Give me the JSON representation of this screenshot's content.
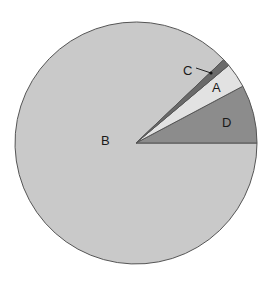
{
  "chart_data": {
    "type": "pie",
    "title": "",
    "categories": [
      "D",
      "A",
      "C",
      "B"
    ],
    "values": [
      7.8,
      3.4,
      1.0,
      87.8
    ],
    "angles_deg": [
      28,
      12,
      3.5,
      316.5
    ],
    "colors": [
      "#8c8c8c",
      "#e2e2e2",
      "#6a6a6a",
      "#c9c9c9"
    ],
    "start_angle_deg": 0,
    "direction": "counterclockwise",
    "legend": "none",
    "annotations": [
      {
        "label": "C",
        "leader_line": true
      }
    ]
  },
  "labels": {
    "A": "A",
    "B": "B",
    "C": "C",
    "D": "D"
  },
  "style": {
    "outline": "#555555",
    "background": "#ffffff"
  }
}
